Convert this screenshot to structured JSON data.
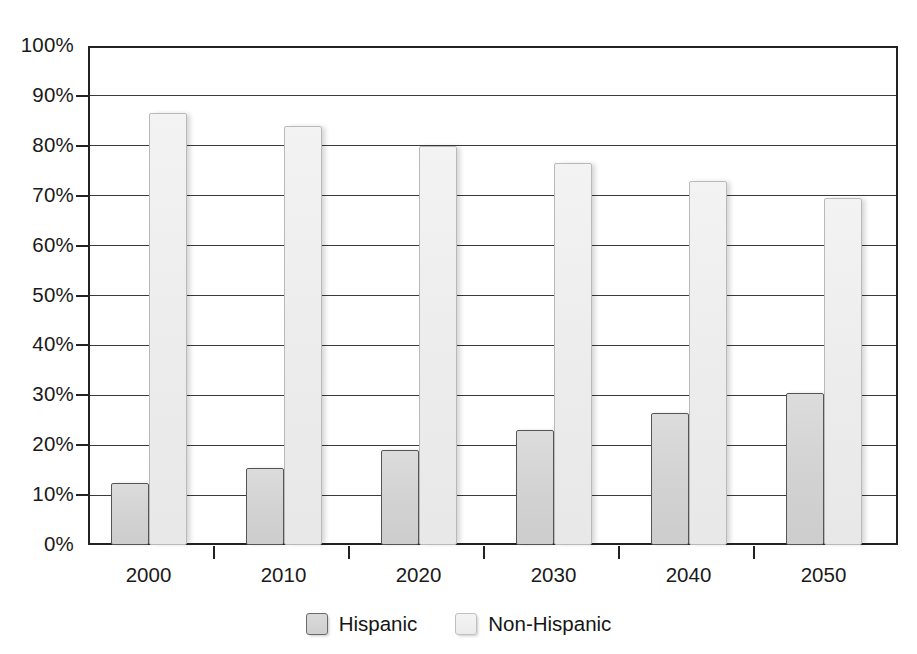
{
  "chart_data": {
    "type": "bar",
    "title": "",
    "subtitle": "",
    "xlabel": "",
    "ylabel": "",
    "categories": [
      "2000",
      "2010",
      "2020",
      "2030",
      "2040",
      "2050"
    ],
    "series": [
      {
        "name": "Hispanic",
        "color": "#d2d2d2",
        "values": [
          12.5,
          15.5,
          19.0,
          23.0,
          26.5,
          30.5
        ]
      },
      {
        "name": "Non-Hispanic",
        "color": "#ececec",
        "values": [
          86.5,
          84.0,
          80.0,
          76.5,
          73.0,
          69.5
        ]
      }
    ],
    "ylim": [
      0,
      100
    ],
    "y_ticks": [
      0,
      10,
      20,
      30,
      40,
      50,
      60,
      70,
      80,
      90,
      100
    ],
    "y_tick_labels": [
      "0%",
      "10%",
      "20%",
      "30%",
      "40%",
      "50%",
      "60%",
      "70%",
      "80%",
      "90%",
      "100%"
    ],
    "grid": true,
    "legend_position": "bottom",
    "legend_entries": [
      "Hispanic",
      "Non-Hispanic"
    ],
    "annotations": []
  },
  "legend": {
    "hispanic_label": "Hispanic",
    "nonhispanic_label": "Non-Hispanic"
  }
}
